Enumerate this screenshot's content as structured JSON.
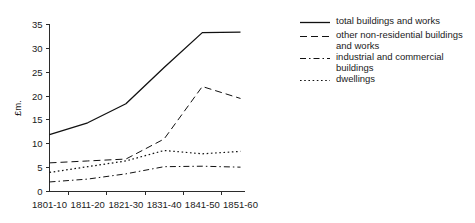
{
  "chart_data": {
    "type": "line",
    "title": "",
    "xlabel": "",
    "ylabel": "£m.",
    "categories": [
      "1801-10",
      "1811-20",
      "1821-30",
      "1831-40",
      "1841-50",
      "1851-60"
    ],
    "ylim": [
      0,
      35
    ],
    "yticks": [
      0,
      5,
      10,
      15,
      20,
      25,
      30,
      35
    ],
    "grid": false,
    "legend_position": "right",
    "series": [
      {
        "name": "total buildings and works",
        "style": "solid",
        "values": [
          11.9,
          14.4,
          18.4,
          26.0,
          33.3,
          33.4
        ]
      },
      {
        "name": "other non-residential buildings and works",
        "style": "dashed",
        "values": [
          6.0,
          6.4,
          6.8,
          11.0,
          22.0,
          19.5
        ]
      },
      {
        "name": "industrial and commercial buildings",
        "style": "dashdot",
        "values": [
          2.0,
          2.6,
          3.7,
          5.2,
          5.3,
          5.1
        ]
      },
      {
        "name": "dwellings",
        "style": "dotted",
        "values": [
          4.0,
          5.2,
          6.4,
          8.6,
          7.9,
          8.4
        ]
      }
    ]
  },
  "axis": {
    "y_tick_labels": [
      "0",
      "5",
      "10",
      "15",
      "20",
      "25",
      "30",
      "35"
    ],
    "y_axis_title": "£m.",
    "x_tick_labels": [
      "1801-10",
      "1811-20",
      "1821-30",
      "1831-40",
      "1841-50",
      "1851-60"
    ]
  },
  "legend": {
    "items": [
      {
        "label": "total buildings and works",
        "style": "solid"
      },
      {
        "label": "other non-residential buildings\nand works",
        "style": "dashed"
      },
      {
        "label": "industrial and commercial\nbuildings",
        "style": "dashdot"
      },
      {
        "label": "dwellings",
        "style": "dotted"
      }
    ]
  }
}
